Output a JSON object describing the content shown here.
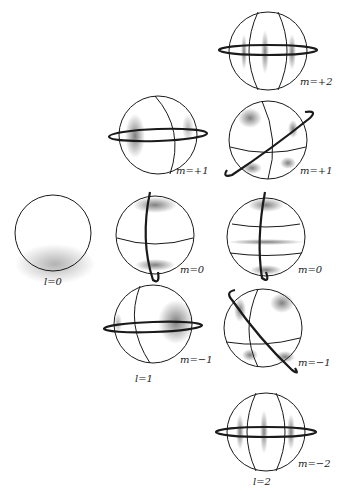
{
  "figure": {
    "colors": {
      "line": "#1a1a1a",
      "shade": "#555555",
      "background": "#ffffff"
    },
    "modes": [
      {
        "id": "l0",
        "l": 0,
        "label": "l=0"
      },
      {
        "id": "l1-m+1",
        "l": 1,
        "m": "+1",
        "label": "m=+1"
      },
      {
        "id": "l1-m0",
        "l": 1,
        "m": "0",
        "label": "m=0"
      },
      {
        "id": "l1-m-1",
        "l": 1,
        "m": "-1",
        "label": "m=−1"
      },
      {
        "id": "l2-m+2",
        "l": 2,
        "m": "+2",
        "label": "m=+2"
      },
      {
        "id": "l2-m+1",
        "l": 2,
        "m": "+1",
        "label": "m=+1"
      },
      {
        "id": "l2-m0",
        "l": 2,
        "m": "0",
        "label": "m=0"
      },
      {
        "id": "l2-m-1",
        "l": 2,
        "m": "-1",
        "label": "m=−1"
      },
      {
        "id": "l2-m-2",
        "l": 2,
        "m": "-2",
        "label": "m=−2"
      }
    ],
    "column_labels": {
      "l1": "l=1",
      "l2": "l=2"
    }
  }
}
